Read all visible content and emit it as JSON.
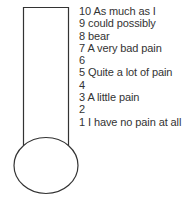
{
  "diagram": {
    "type": "pain-thermometer",
    "colors": {
      "stroke": "#333333",
      "fill": "#ffffff",
      "text": "#333333"
    }
  },
  "scale": [
    {
      "value": "10",
      "label": "As much as I"
    },
    {
      "value": "9",
      "label": "could possibly"
    },
    {
      "value": "8",
      "label": "bear"
    },
    {
      "value": "7",
      "label": "A very bad pain"
    },
    {
      "value": "6",
      "label": ""
    },
    {
      "value": "5",
      "label": "Quite a lot of pain"
    },
    {
      "value": "4",
      "label": ""
    },
    {
      "value": "3",
      "label": "A little pain"
    },
    {
      "value": "2",
      "label": ""
    },
    {
      "value": "1",
      "label": "I have no pain at all"
    }
  ]
}
